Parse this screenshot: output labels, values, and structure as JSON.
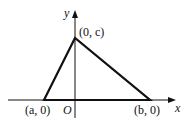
{
  "diagram": {
    "type": "coordinate-triangle",
    "axes": {
      "x_label": "x",
      "y_label": "y",
      "origin_label": "O"
    },
    "vertices": [
      {
        "label": "(a, 0)",
        "px": [
          44,
          100
        ]
      },
      {
        "label": "(0, c)",
        "px": [
          75,
          38
        ]
      },
      {
        "label": "(b, 0)",
        "px": [
          150,
          100
        ]
      }
    ],
    "colors": {
      "stroke": "#111111",
      "background": "#ffffff"
    }
  }
}
